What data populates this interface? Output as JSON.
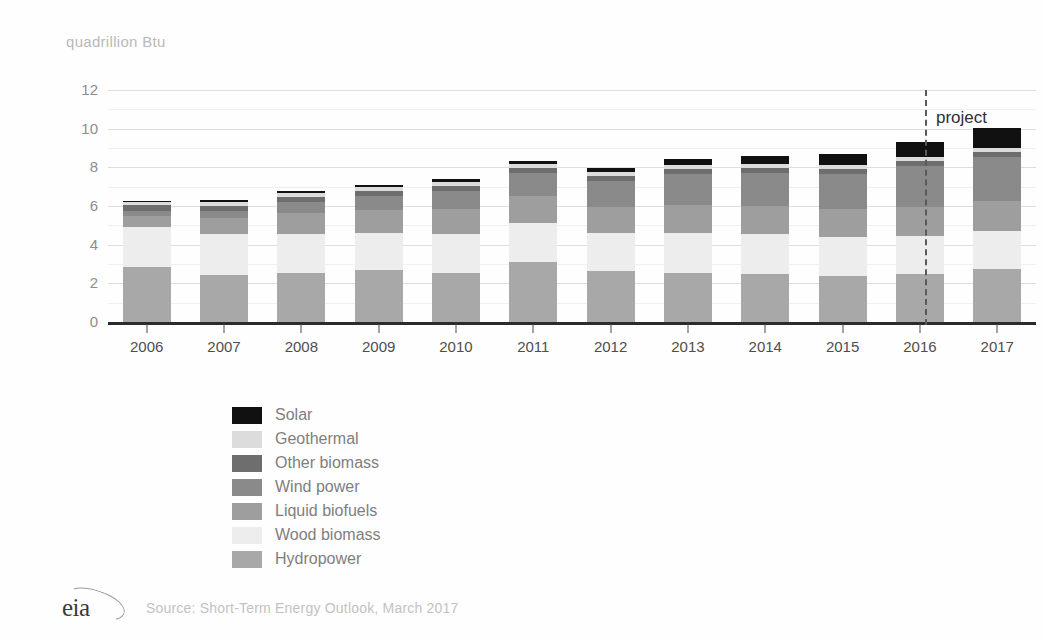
{
  "chart_data": {
    "type": "bar",
    "stacked": true,
    "title": "",
    "ylabel": "quadrillion Btu",
    "xlabel": "",
    "ylim": [
      0,
      12
    ],
    "yticks": [
      0,
      2,
      4,
      6,
      8,
      10,
      12
    ],
    "minor_gridlines": [
      1,
      3,
      5,
      7,
      9,
      11
    ],
    "grid": true,
    "legend_position": "bottom-center",
    "categories": [
      "2006",
      "2007",
      "2008",
      "2009",
      "2010",
      "2011",
      "2012",
      "2013",
      "2014",
      "2015",
      "2016",
      "2017"
    ],
    "series": [
      {
        "name": "Hydropower",
        "color": "#a8a8a8",
        "values": [
          2.87,
          2.45,
          2.51,
          2.67,
          2.53,
          3.1,
          2.63,
          2.56,
          2.47,
          2.39,
          2.47,
          2.73
        ]
      },
      {
        "name": "Wood biomass",
        "color": "#ededed",
        "values": [
          2.03,
          2.08,
          2.04,
          1.96,
          2.0,
          2.02,
          1.96,
          2.07,
          2.07,
          2.01,
          1.99,
          1.99
        ]
      },
      {
        "name": "Liquid biofuels",
        "color": "#9e9e9e",
        "values": [
          0.59,
          0.87,
          1.11,
          1.19,
          1.33,
          1.4,
          1.35,
          1.41,
          1.44,
          1.47,
          1.51,
          1.53
        ]
      },
      {
        "name": "Wind power",
        "color": "#8a8a8a",
        "values": [
          0.26,
          0.34,
          0.55,
          0.72,
          0.92,
          1.17,
          1.34,
          1.6,
          1.73,
          1.78,
          2.11,
          2.28
        ]
      },
      {
        "name": "Other biomass",
        "color": "#6e6e6e",
        "values": [
          0.28,
          0.28,
          0.28,
          0.26,
          0.27,
          0.26,
          0.25,
          0.26,
          0.26,
          0.25,
          0.26,
          0.26
        ]
      },
      {
        "name": "Geothermal",
        "color": "#dcdcdc",
        "values": [
          0.18,
          0.19,
          0.19,
          0.2,
          0.21,
          0.21,
          0.21,
          0.21,
          0.21,
          0.22,
          0.22,
          0.22
        ]
      },
      {
        "name": "Solar",
        "color": "#111111",
        "values": [
          0.07,
          0.08,
          0.09,
          0.1,
          0.12,
          0.16,
          0.23,
          0.31,
          0.43,
          0.57,
          0.77,
          1.01
        ]
      }
    ],
    "annotations": [
      {
        "name": "projection-divider",
        "type": "vline",
        "x_between": [
          "2016",
          "2017"
        ],
        "style": "dashed"
      },
      {
        "name": "projection-label",
        "type": "text",
        "text": "project"
      }
    ]
  },
  "axis": {
    "unit_label": "quadrillion Btu",
    "ytick_labels": [
      "12",
      "10",
      "8",
      "6",
      "4",
      "2",
      "0"
    ],
    "xtick_labels": [
      "2006",
      "2007",
      "2008",
      "2009",
      "2010",
      "2011",
      "2012",
      "2013",
      "2014",
      "2015",
      "2016",
      "2017"
    ]
  },
  "projection": {
    "label": "project"
  },
  "legend": {
    "items": [
      {
        "label": "Solar",
        "color": "#111111"
      },
      {
        "label": "Geothermal",
        "color": "#dcdcdc"
      },
      {
        "label": "Other biomass",
        "color": "#6e6e6e"
      },
      {
        "label": "Wind power",
        "color": "#8a8a8a"
      },
      {
        "label": "Liquid biofuels",
        "color": "#9e9e9e"
      },
      {
        "label": "Wood biomass",
        "color": "#ededed"
      },
      {
        "label": "Hydropower",
        "color": "#a8a8a8"
      }
    ]
  },
  "footer": {
    "logo_text": "eia",
    "source": "Source: Short-Term Energy Outlook, March 2017"
  }
}
